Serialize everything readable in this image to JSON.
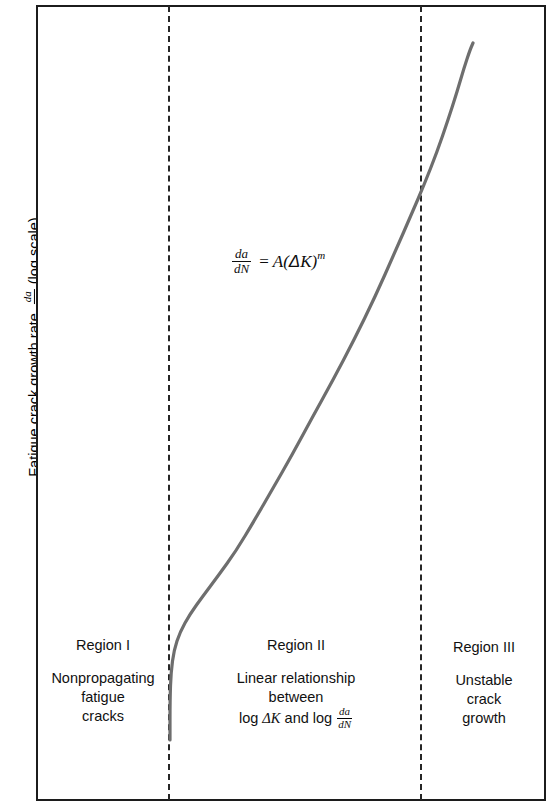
{
  "figure": {
    "y_axis_label_prefix": "Fatigue crack growth rate,",
    "y_axis_label_suffix": "(log scale)",
    "y_axis_fraction_numerator": "da",
    "y_axis_fraction_denominator": "dN",
    "equation": {
      "lhs_numerator": "da",
      "lhs_denominator": "dN",
      "equals": "=",
      "rhs_coefficient": "A",
      "rhs_open_paren": "(",
      "rhs_delta": "Δ",
      "rhs_variable": "K",
      "rhs_close_paren": ")",
      "rhs_exponent": "m",
      "full_text": "da/dN = A(ΔK)^m"
    },
    "regions": [
      {
        "name": "Region I",
        "lines": [
          "Nonpropagating",
          "fatigue",
          "cracks"
        ]
      },
      {
        "name": "Region II",
        "lines": [
          "Linear relationship",
          "between"
        ],
        "last_line_prefix": "log ",
        "last_line_delta": "ΔK",
        "last_line_middle": " and log ",
        "last_line_fraction_numerator": "da",
        "last_line_fraction_denominator": "dN"
      },
      {
        "name": "Region III",
        "lines": [
          "Unstable",
          "crack",
          "growth"
        ]
      }
    ]
  },
  "chart_data": {
    "type": "line",
    "title": "",
    "xlabel": "",
    "ylabel": "Fatigue crack growth rate, da/dN (log scale)",
    "grid": false,
    "legend_position": "none",
    "axis_ticks": [],
    "annotations": [
      "da/dN = A(ΔK)^m",
      "Region I — Nonpropagating fatigue cracks",
      "Region II — Linear relationship between log ΔK and log da/dN",
      "Region III — Unstable crack growth"
    ],
    "region_boundaries_x": [
      168,
      420
    ],
    "curve_color": "#6e6e6e",
    "series": [
      {
        "name": "sigmoidal da/dN vs ΔK curve",
        "points": [
          [
            170,
            740
          ],
          [
            170,
            700
          ],
          [
            171,
            672
          ],
          [
            174,
            650
          ],
          [
            180,
            632
          ],
          [
            190,
            614
          ],
          [
            203,
            596
          ],
          [
            218,
            576
          ],
          [
            236,
            551
          ],
          [
            254,
            521
          ],
          [
            272,
            490
          ],
          [
            292,
            455
          ],
          [
            312,
            418
          ],
          [
            333,
            380
          ],
          [
            354,
            340
          ],
          [
            375,
            297
          ],
          [
            395,
            252
          ],
          [
            412,
            213
          ],
          [
            424,
            185
          ],
          [
            437,
            152
          ],
          [
            448,
            120
          ],
          [
            457,
            92
          ],
          [
            464,
            68
          ],
          [
            470,
            50
          ],
          [
            473,
            43
          ]
        ]
      }
    ]
  }
}
